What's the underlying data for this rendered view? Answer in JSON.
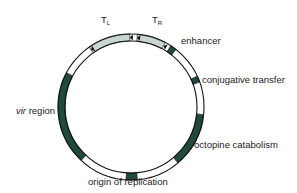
{
  "diagram": {
    "type": "plasmid-map",
    "colors": {
      "region": "#1f4a3c",
      "tdna": "#c9d6cf",
      "outline": "#111111",
      "background": "#ffffff"
    },
    "geometry": {
      "cx": 131,
      "cy": 107,
      "r_outer": 73,
      "r_inner": 66
    },
    "segments": [
      {
        "name": "T_L",
        "start": -35,
        "end": -1,
        "fill": "tdna"
      },
      {
        "name": "T_R",
        "start": 5,
        "end": 28,
        "fill": "tdna"
      },
      {
        "name": "enhancer",
        "start": 33,
        "end": 38,
        "fill": "region"
      },
      {
        "name": "conjugative transfer",
        "start": 65,
        "end": 70,
        "fill": "region"
      },
      {
        "name": "octopine catabolism",
        "start": 96,
        "end": 140,
        "fill": "region"
      },
      {
        "name": "origin of replication",
        "start": 175,
        "end": 184,
        "fill": "region"
      },
      {
        "name": "vir region",
        "start": 223,
        "end": 298,
        "fill": "region"
      }
    ],
    "borders": [
      {
        "name": "left border start",
        "angle": -35
      },
      {
        "name": "left border end",
        "angle": -1
      },
      {
        "name": "right border start",
        "angle": 5
      },
      {
        "name": "right border end",
        "angle": 28
      }
    ]
  },
  "labels": {
    "tl_main": "T",
    "tl_sub": "L",
    "tr_main": "T",
    "tr_sub": "R",
    "enhancer": "enhancer",
    "conjugative": "conjugative transfer",
    "vir_italic": "vir",
    "vir_rest": " region",
    "octopine": "octopine catabolism",
    "origin": "origin of replication"
  }
}
